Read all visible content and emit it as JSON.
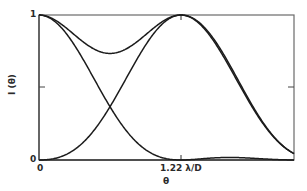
{
  "chart_data": {
    "type": "line",
    "title": "",
    "subtitle": "Rayleigh criterion: two Airy diffraction patterns separated by 1.22 λ/D and their sum",
    "xlabel": "θ",
    "ylabel": "I(θ)",
    "x_tick_labels": [
      "0",
      "1.22 λ/D"
    ],
    "x_tick_positions_lambda_over_D": [
      0,
      1.22
    ],
    "y_tick_labels": [
      "0",
      "1"
    ],
    "y_tick_positions": [
      0,
      0.5,
      1
    ],
    "xlim_lambda_over_D": [
      0,
      2.2
    ],
    "ylim": [
      0,
      1
    ],
    "grid": false,
    "legend": null,
    "x": [
      0,
      0.1,
      0.2,
      0.3,
      0.4,
      0.5,
      0.6,
      0.7,
      0.8,
      0.9,
      1.0,
      1.1,
      1.22,
      1.3,
      1.4,
      1.5,
      1.6,
      1.7,
      1.8,
      1.9,
      2.0,
      2.1,
      2.2
    ],
    "series": [
      {
        "name": "Source 1 (centered at θ = 0)",
        "values": [
          1.0,
          0.976,
          0.905,
          0.796,
          0.662,
          0.516,
          0.375,
          0.249,
          0.148,
          0.074,
          0.029,
          0.006,
          0.0,
          0.001,
          0.004,
          0.008,
          0.013,
          0.016,
          0.016,
          0.013,
          0.009,
          0.005,
          0.001
        ]
      },
      {
        "name": "Source 2 (centered at θ = 1.22 λ/D)",
        "values": [
          0.0,
          0.006,
          0.029,
          0.074,
          0.148,
          0.249,
          0.375,
          0.516,
          0.662,
          0.796,
          0.905,
          0.976,
          1.0,
          0.985,
          0.905,
          0.796,
          0.662,
          0.516,
          0.375,
          0.249,
          0.148,
          0.074,
          0.029
        ]
      },
      {
        "name": "Sum (normalized)",
        "values": [
          1.0,
          0.982,
          0.934,
          0.87,
          0.81,
          0.765,
          0.75,
          0.765,
          0.81,
          0.87,
          0.934,
          0.982,
          1.0,
          0.986,
          0.909,
          0.804,
          0.675,
          0.532,
          0.391,
          0.262,
          0.157,
          0.079,
          0.03
        ]
      }
    ],
    "annotations": {
      "sum_dip_value": 0.73,
      "crossing_value": 0.37,
      "crossing_x_lambda_over_D": 0.61
    },
    "line_color": "#1c1c1c",
    "axis_color": "#555555",
    "background": "#ffffff"
  },
  "labels": {
    "y_top": "1",
    "y_bottom": "0",
    "x_origin": "0",
    "x_mark": "1.22 λ/D",
    "x_title": "θ",
    "y_title": "I (θ)"
  }
}
